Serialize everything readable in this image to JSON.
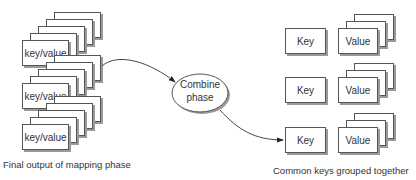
{
  "diagram": {
    "left_stacks": [
      {
        "label": "key/value"
      },
      {
        "label": "key/value"
      },
      {
        "label": "key/value"
      }
    ],
    "combine": {
      "line1": "Combine",
      "line2": "phase"
    },
    "right_rows": [
      {
        "key": "Key",
        "value": "Value"
      },
      {
        "key": "Key",
        "value": "Value"
      },
      {
        "key": "Key",
        "value": "Value"
      }
    ],
    "captions": {
      "left": "Final output of mapping phase",
      "right": "Common keys grouped together"
    },
    "colors": {
      "stroke": "#555555",
      "shadow": "#9a9a9a",
      "text": "#333333"
    }
  }
}
